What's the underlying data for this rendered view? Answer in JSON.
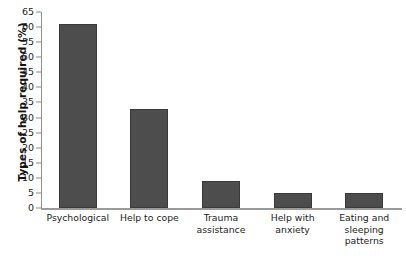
{
  "chart_data": {
    "type": "bar",
    "title": "",
    "subtitle": "",
    "xlabel": "",
    "ylabel": "Types of help required (%)",
    "categories": [
      "Psychological",
      "Help to cope",
      "Trauma\nassistance",
      "Help with\nanxiety",
      "Eating and\nsleeping\npatterns"
    ],
    "values": [
      61,
      33,
      9,
      5,
      5
    ],
    "ylim": [
      0,
      65
    ],
    "ytick_step": 5,
    "yticks": [
      0,
      5,
      10,
      15,
      20,
      25,
      30,
      35,
      40,
      45,
      50,
      55,
      60,
      65
    ],
    "grid": false,
    "legend": "none",
    "bar_color": "#4d4d4d",
    "bar_edge_color": "#3a3a3a",
    "axis_color": "#9a9a9a",
    "background_color": "#ffffff"
  }
}
